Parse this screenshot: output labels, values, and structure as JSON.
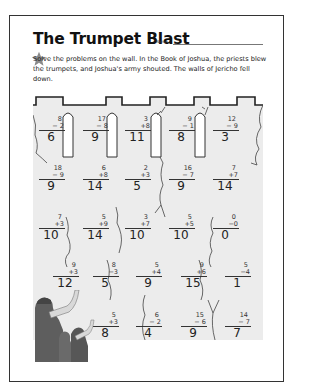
{
  "worksheet": {
    "title": "The Trumpet Blast",
    "name_label": "Name",
    "instructions": "Solve the problems on the wall. In the Book of Joshua, the priests blew the trumpets, and Joshua's army shouted. The walls of Jericho fell down.",
    "icons": {
      "star": "star-icon",
      "trumpeters": "trumpeters-illustration"
    },
    "colors": {
      "wall_fill": "#ececec",
      "wall_outline": "#333333",
      "star": "#8a8a8a",
      "figures": "#5a5a5a"
    }
  },
  "problems": [
    [
      {
        "a": "8",
        "op": "−",
        "b": "2",
        "answer": "6"
      },
      {
        "a": "17",
        "op": "−",
        "b": "8",
        "answer": "9"
      },
      {
        "a": "3",
        "op": "+",
        "b": "8",
        "answer": "11"
      },
      {
        "a": "9",
        "op": "−",
        "b": "1",
        "answer": "8"
      },
      {
        "a": "12",
        "op": "−",
        "b": "9",
        "answer": "3"
      }
    ],
    [
      {
        "a": "18",
        "op": "−",
        "b": "9",
        "answer": "9"
      },
      {
        "a": "6",
        "op": "+",
        "b": "8",
        "answer": "14"
      },
      {
        "a": "2",
        "op": "+",
        "b": "3",
        "answer": "5"
      },
      {
        "a": "16",
        "op": "−",
        "b": "7",
        "answer": "9"
      },
      {
        "a": "7",
        "op": "+",
        "b": "7",
        "answer": "14"
      }
    ],
    [
      {
        "a": "7",
        "op": "+",
        "b": "3",
        "answer": "10"
      },
      {
        "a": "5",
        "op": "+",
        "b": "9",
        "answer": "14"
      },
      {
        "a": "3",
        "op": "+",
        "b": "7",
        "answer": "10"
      },
      {
        "a": "5",
        "op": "+",
        "b": "5",
        "answer": "10"
      },
      {
        "a": "0",
        "op": "−",
        "b": "0",
        "answer": "0"
      }
    ],
    [
      {
        "a": "9",
        "op": "+",
        "b": "3",
        "answer": "12"
      },
      {
        "a": "8",
        "op": "−",
        "b": "3",
        "answer": "5"
      },
      {
        "a": "5",
        "op": "+",
        "b": "4",
        "answer": "9"
      },
      {
        "a": "9",
        "op": "+",
        "b": "6",
        "answer": "15"
      },
      {
        "a": "5",
        "op": "−",
        "b": "4",
        "answer": "1"
      }
    ],
    [
      null,
      {
        "a": "5",
        "op": "+",
        "b": "3",
        "answer": "8"
      },
      {
        "a": "6",
        "op": "−",
        "b": "2",
        "answer": "4"
      },
      {
        "a": "15",
        "op": "−",
        "b": "6",
        "answer": "9"
      },
      {
        "a": "14",
        "op": "−",
        "b": "7",
        "answer": "7"
      }
    ]
  ]
}
